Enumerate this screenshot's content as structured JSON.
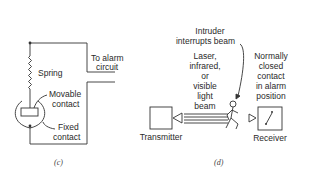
{
  "panel_c": {
    "caption": "(c)",
    "labels": {
      "to_alarm_line1": "To alarm",
      "to_alarm_line2": "circuit",
      "spring": "Spring",
      "movable_line1": "Movable",
      "movable_line2": "contact",
      "fixed_line1": "Fixed",
      "fixed_line2": "contact"
    }
  },
  "panel_d": {
    "caption": "(d)",
    "labels": {
      "intruder_line1": "Intruder",
      "intruder_line2": "interrupts beam",
      "beam_line1": "Laser,",
      "beam_line2": "infrared,",
      "beam_line3": "or",
      "beam_line4": "visible",
      "beam_line5": "light",
      "beam_line6": "beam",
      "normally_line1": "Normally",
      "normally_line2": "closed",
      "normally_line3": "contact",
      "normally_line4": "in alarm",
      "normally_line5": "position",
      "transmitter": "Transmitter",
      "receiver": "Receiver"
    }
  },
  "colors": {
    "line": "#333333",
    "background": "#ffffff"
  }
}
